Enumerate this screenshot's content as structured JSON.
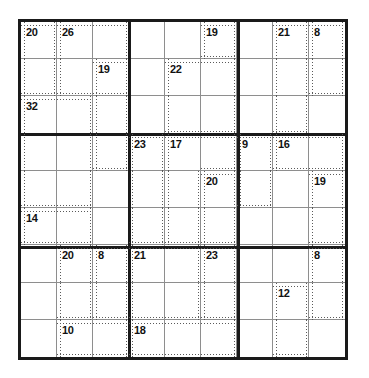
{
  "puzzle": {
    "type": "killer-sudoku",
    "grid_size": 9,
    "box_size": 3,
    "given_digits": [],
    "colors": {
      "grid_border": "#1a1a1a",
      "box_border": "#1a1a1a",
      "cell_border": "#8e8e8e",
      "cage_border": "#5a5a5a",
      "cage_sum_text": "#111111",
      "background": "#ffffff"
    },
    "cages": [
      {
        "sum": "20",
        "anchor": {
          "r": 0,
          "c": 0
        },
        "cells": [
          [
            0,
            0
          ],
          [
            1,
            0
          ]
        ]
      },
      {
        "sum": "26",
        "anchor": {
          "r": 0,
          "c": 1
        },
        "cells": [
          [
            0,
            1
          ],
          [
            0,
            2
          ],
          [
            1,
            1
          ],
          [
            1,
            2
          ]
        ]
      },
      {
        "sum": "19",
        "anchor": {
          "r": 1,
          "c": 2
        },
        "cells": [
          [
            1,
            2
          ],
          [
            2,
            2
          ],
          [
            3,
            2
          ]
        ]
      },
      {
        "sum": "32",
        "anchor": {
          "r": 2,
          "c": 0
        },
        "cells": [
          [
            2,
            0
          ],
          [
            2,
            1
          ],
          [
            3,
            0
          ],
          [
            3,
            1
          ],
          [
            4,
            0
          ],
          [
            4,
            1
          ]
        ]
      },
      {
        "sum": "19",
        "anchor": {
          "r": 0,
          "c": 5
        },
        "cells": [
          [
            0,
            5
          ]
        ]
      },
      {
        "sum": "22",
        "anchor": {
          "r": 1,
          "c": 4
        },
        "cells": [
          [
            1,
            4
          ],
          [
            1,
            5
          ],
          [
            2,
            4
          ],
          [
            2,
            5
          ]
        ]
      },
      {
        "sum": "21",
        "anchor": {
          "r": 0,
          "c": 7
        },
        "cells": [
          [
            0,
            7
          ],
          [
            1,
            7
          ],
          [
            2,
            7
          ]
        ]
      },
      {
        "sum": "8",
        "anchor": {
          "r": 0,
          "c": 8
        },
        "cells": [
          [
            0,
            8
          ],
          [
            1,
            8
          ]
        ]
      },
      {
        "sum": "23",
        "anchor": {
          "r": 3,
          "c": 3
        },
        "cells": [
          [
            3,
            3
          ],
          [
            4,
            3
          ],
          [
            5,
            3
          ]
        ]
      },
      {
        "sum": "17",
        "anchor": {
          "r": 3,
          "c": 4
        },
        "cells": [
          [
            3,
            4
          ],
          [
            3,
            5
          ],
          [
            4,
            4
          ],
          [
            5,
            4
          ]
        ]
      },
      {
        "sum": "20",
        "anchor": {
          "r": 4,
          "c": 5
        },
        "cells": [
          [
            4,
            5
          ],
          [
            5,
            5
          ]
        ]
      },
      {
        "sum": "9",
        "anchor": {
          "r": 3,
          "c": 6
        },
        "cells": [
          [
            3,
            6
          ],
          [
            4,
            6
          ]
        ]
      },
      {
        "sum": "16",
        "anchor": {
          "r": 3,
          "c": 7
        },
        "cells": [
          [
            3,
            7
          ],
          [
            3,
            8
          ]
        ]
      },
      {
        "sum": "19",
        "anchor": {
          "r": 4,
          "c": 8
        },
        "cells": [
          [
            4,
            8
          ],
          [
            5,
            8
          ]
        ]
      },
      {
        "sum": "14",
        "anchor": {
          "r": 5,
          "c": 0
        },
        "cells": [
          [
            5,
            0
          ],
          [
            5,
            1
          ]
        ]
      },
      {
        "sum": "20",
        "anchor": {
          "r": 6,
          "c": 1
        },
        "cells": [
          [
            6,
            1
          ],
          [
            7,
            1
          ]
        ]
      },
      {
        "sum": "8",
        "anchor": {
          "r": 6,
          "c": 2
        },
        "cells": [
          [
            6,
            2
          ],
          [
            7,
            2
          ]
        ]
      },
      {
        "sum": "10",
        "anchor": {
          "r": 8,
          "c": 1
        },
        "cells": [
          [
            8,
            1
          ],
          [
            8,
            2
          ]
        ]
      },
      {
        "sum": "21",
        "anchor": {
          "r": 6,
          "c": 3
        },
        "cells": [
          [
            6,
            3
          ],
          [
            6,
            4
          ],
          [
            7,
            3
          ],
          [
            7,
            4
          ]
        ]
      },
      {
        "sum": "23",
        "anchor": {
          "r": 6,
          "c": 5
        },
        "cells": [
          [
            6,
            5
          ],
          [
            7,
            5
          ]
        ]
      },
      {
        "sum": "18",
        "anchor": {
          "r": 8,
          "c": 3
        },
        "cells": [
          [
            8,
            3
          ],
          [
            8,
            4
          ],
          [
            8,
            5
          ]
        ]
      },
      {
        "sum": "8",
        "anchor": {
          "r": 6,
          "c": 8
        },
        "cells": [
          [
            6,
            8
          ],
          [
            7,
            8
          ]
        ]
      },
      {
        "sum": "12",
        "anchor": {
          "r": 7,
          "c": 7
        },
        "cells": [
          [
            7,
            7
          ],
          [
            8,
            7
          ]
        ]
      }
    ],
    "cage_sum_labels": [
      "20",
      "26",
      "19",
      "19",
      "21",
      "8",
      "19",
      "22",
      "32",
      "23",
      "17",
      "9",
      "16",
      "20",
      "19",
      "14",
      "20",
      "8",
      "21",
      "23",
      "8",
      "12",
      "10",
      "18"
    ]
  }
}
